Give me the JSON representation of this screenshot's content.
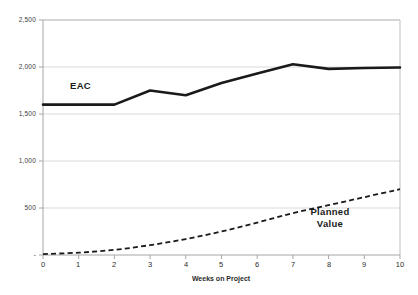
{
  "chart_data": {
    "type": "line",
    "title": "",
    "xlabel": "Weeks on Project",
    "ylabel": "",
    "xlim": [
      0,
      10
    ],
    "ylim": [
      0,
      2500
    ],
    "grid": true,
    "legend_position": "inline-annotation",
    "x": [
      0,
      1,
      2,
      3,
      4,
      5,
      6,
      7,
      8,
      9,
      10
    ],
    "xtick_labels": [
      "0",
      "1",
      "2",
      "3",
      "4",
      "5",
      "6",
      "7",
      "8",
      "9",
      "10"
    ],
    "ytick_values": [
      0,
      500,
      1000,
      1500,
      2000,
      2500
    ],
    "ytick_labels": [
      "-",
      "500",
      "1,000",
      "1,500",
      "2,000",
      "2,500"
    ],
    "series": [
      {
        "name": "EAC",
        "style": "solid",
        "color": "#1a1a1a",
        "width": 2.6,
        "values": [
          1600,
          1600,
          1600,
          1750,
          1700,
          1830,
          1930,
          2030,
          1980,
          1990,
          1995
        ]
      },
      {
        "name": "Planned Value",
        "style": "dashed",
        "color": "#1a1a1a",
        "width": 1.8,
        "values": [
          10,
          25,
          55,
          105,
          170,
          250,
          345,
          445,
          530,
          615,
          700
        ]
      }
    ],
    "annotations": [
      {
        "text": "EAC",
        "x": 1.35,
        "y": 1760
      },
      {
        "text": "Planned Value",
        "x": 8.1,
        "y": 430
      }
    ]
  },
  "labels": {
    "ytick_0": "-",
    "ytick_500": "500",
    "ytick_1000": "1,000",
    "ytick_1500": "1,500",
    "ytick_2000": "2,000",
    "ytick_2500": "2,500",
    "xtick_0": "0",
    "xtick_1": "1",
    "xtick_2": "2",
    "xtick_3": "3",
    "xtick_4": "4",
    "xtick_5": "5",
    "xtick_6": "6",
    "xtick_7": "7",
    "xtick_8": "8",
    "xtick_9": "9",
    "xtick_10": "10",
    "x_axis_title": "Weeks on Project",
    "eac_label": "EAC",
    "planned_value_line1": "Planned",
    "planned_value_line2": "Value"
  },
  "colors": {
    "series_line": "#1a1a1a",
    "gridline": "#d9d9d9",
    "axis": "#a6a6a6",
    "tick_text": "#3b3b3b",
    "background": "#ffffff"
  }
}
